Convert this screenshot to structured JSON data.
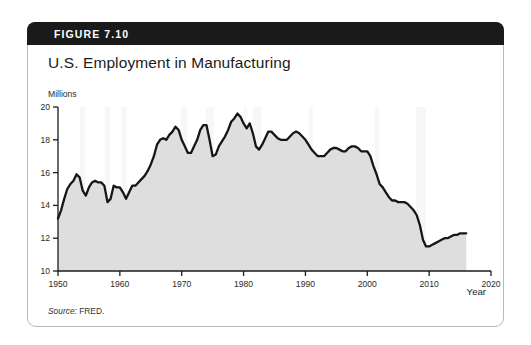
{
  "figure": {
    "label": "FIGURE 7.10",
    "title": "U.S. Employment in Manufacturing",
    "source": "Source: FRED.",
    "source_word": "Source:",
    "source_value": " FRED."
  },
  "colors": {
    "header_bar": "#1a1a1a",
    "card_border": "#b9b9b9",
    "area_fill": "#dedede",
    "line": "#161616",
    "recession_band": "#f7f7f7",
    "axis": "#1b1b1b",
    "text": "#1b1b1b"
  },
  "chart_data": {
    "type": "area",
    "title": "U.S. Employment in Manufacturing",
    "xlabel": "Year",
    "ylabel": "Millions",
    "xlim": [
      1950,
      2020
    ],
    "ylim": [
      10,
      20
    ],
    "grid": false,
    "legend": null,
    "x_ticks": [
      "1950",
      "1960",
      "1970",
      "1980",
      "1990",
      "2000",
      "2010",
      "2020"
    ],
    "x_tick_values": [
      1950,
      1960,
      1970,
      1980,
      1990,
      2000,
      2010,
      2020
    ],
    "y_ticks": [
      "10",
      "12",
      "14",
      "16",
      "18",
      "20"
    ],
    "y_tick_values": [
      10,
      12,
      14,
      16,
      18,
      20
    ],
    "units": "Millions of persons",
    "series_name": "Manufacturing employment",
    "x": [
      1950,
      1950.5,
      1951,
      1951.5,
      1952,
      1952.5,
      1953,
      1953.5,
      1954,
      1954.5,
      1955,
      1955.5,
      1956,
      1956.5,
      1957,
      1957.5,
      1958,
      1958.5,
      1959,
      1959.5,
      1960,
      1960.5,
      1961,
      1961.5,
      1962,
      1962.5,
      1963,
      1963.5,
      1964,
      1964.5,
      1965,
      1965.5,
      1966,
      1966.5,
      1967,
      1967.5,
      1968,
      1968.5,
      1969,
      1969.5,
      1970,
      1970.5,
      1971,
      1971.5,
      1972,
      1972.5,
      1973,
      1973.5,
      1974,
      1974.5,
      1975,
      1975.5,
      1976,
      1976.5,
      1977,
      1977.5,
      1978,
      1978.5,
      1979,
      1979.5,
      1980,
      1980.5,
      1981,
      1981.5,
      1982,
      1982.5,
      1983,
      1983.5,
      1984,
      1984.5,
      1985,
      1985.5,
      1986,
      1986.5,
      1987,
      1987.5,
      1988,
      1988.5,
      1989,
      1989.5,
      1990,
      1990.5,
      1991,
      1991.5,
      1992,
      1992.5,
      1993,
      1993.5,
      1994,
      1994.5,
      1995,
      1995.5,
      1996,
      1996.5,
      1997,
      1997.5,
      1998,
      1998.5,
      1999,
      1999.5,
      2000,
      2000.5,
      2001,
      2001.5,
      2002,
      2002.5,
      2003,
      2003.5,
      2004,
      2004.5,
      2005,
      2005.5,
      2006,
      2006.5,
      2007,
      2007.5,
      2008,
      2008.5,
      2009,
      2009.5,
      2010,
      2010.5,
      2011,
      2011.5,
      2012,
      2012.5,
      2013,
      2013.5,
      2014,
      2014.5,
      2015,
      2015.5,
      2016
    ],
    "values": [
      13.2,
      13.7,
      14.4,
      15.0,
      15.3,
      15.5,
      15.9,
      15.7,
      14.9,
      14.6,
      15.1,
      15.4,
      15.5,
      15.4,
      15.4,
      15.2,
      14.2,
      14.4,
      15.2,
      15.1,
      15.1,
      14.8,
      14.4,
      14.8,
      15.2,
      15.2,
      15.4,
      15.6,
      15.8,
      16.1,
      16.5,
      17.0,
      17.7,
      18.0,
      18.1,
      18.0,
      18.3,
      18.5,
      18.8,
      18.6,
      18.0,
      17.6,
      17.2,
      17.2,
      17.6,
      18.0,
      18.6,
      18.9,
      18.9,
      18.0,
      17.0,
      17.1,
      17.6,
      17.9,
      18.2,
      18.6,
      19.1,
      19.3,
      19.6,
      19.4,
      19.0,
      18.7,
      19.0,
      18.4,
      17.6,
      17.4,
      17.7,
      18.1,
      18.5,
      18.5,
      18.3,
      18.1,
      18.0,
      18.0,
      18.0,
      18.2,
      18.4,
      18.5,
      18.4,
      18.2,
      18.0,
      17.7,
      17.4,
      17.2,
      17.0,
      17.0,
      17.0,
      17.2,
      17.4,
      17.5,
      17.5,
      17.4,
      17.3,
      17.3,
      17.5,
      17.6,
      17.6,
      17.5,
      17.3,
      17.3,
      17.3,
      17.0,
      16.4,
      15.9,
      15.3,
      15.1,
      14.8,
      14.5,
      14.3,
      14.3,
      14.2,
      14.2,
      14.2,
      14.1,
      13.9,
      13.7,
      13.4,
      12.8,
      11.9,
      11.5,
      11.5,
      11.6,
      11.7,
      11.8,
      11.9,
      12.0,
      12.0,
      12.1,
      12.2,
      12.2,
      12.3,
      12.3,
      12.3
    ],
    "recession_bands": [
      {
        "start": 1953.55,
        "end": 1954.4
      },
      {
        "start": 1957.6,
        "end": 1958.4
      },
      {
        "start": 1960.3,
        "end": 1961.1
      },
      {
        "start": 1969.9,
        "end": 1970.9
      },
      {
        "start": 1973.9,
        "end": 1975.2
      },
      {
        "start": 1980.0,
        "end": 1980.6
      },
      {
        "start": 1981.5,
        "end": 1982.9
      },
      {
        "start": 1990.6,
        "end": 1991.2
      },
      {
        "start": 2001.2,
        "end": 2001.9
      },
      {
        "start": 2007.9,
        "end": 2009.5
      }
    ],
    "annotations": [
      "Shaded vertical bands mark U.S. recessions",
      "Peak near 19.6 million around 1979",
      "Trough near 11.5 million around 2010"
    ]
  }
}
